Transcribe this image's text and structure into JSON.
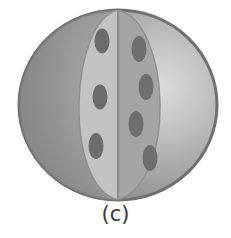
{
  "figure": {
    "caption": "(c)",
    "colors": {
      "outer_left": "#8e8e8e",
      "outer_right": "#c9c9c9",
      "rim": "#6f6f6f",
      "lens_left": "#c2c2c2",
      "lens_right": "#a3a3a3",
      "spot": "#6b6b6b",
      "divider": "#8a8a8a"
    },
    "spots_left": [
      {
        "cx": 102,
        "cy": 41
      },
      {
        "cx": 100,
        "cy": 97
      },
      {
        "cx": 96,
        "cy": 146
      }
    ],
    "spots_right": [
      {
        "cx": 139,
        "cy": 49
      },
      {
        "cx": 146,
        "cy": 87
      },
      {
        "cx": 136,
        "cy": 124
      },
      {
        "cx": 150,
        "cy": 158
      }
    ]
  }
}
